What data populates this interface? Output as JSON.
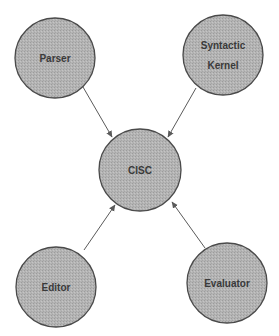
{
  "diagram": {
    "colors": {
      "node_fill": "#b4b4b4",
      "node_stroke": "#4a4a4a",
      "edge": "#5a5a5a",
      "text": "#3a3a3a",
      "background": "#ffffff"
    },
    "nodes": [
      {
        "id": "parser",
        "lines": [
          "Parser"
        ],
        "cx": 55,
        "cy": 58,
        "r": 40
      },
      {
        "id": "syntactic-kernel",
        "lines": [
          "Syntactic",
          "Kernel"
        ],
        "cx": 223,
        "cy": 55,
        "r": 40
      },
      {
        "id": "cisc",
        "lines": [
          "CISC"
        ],
        "cx": 140,
        "cy": 170,
        "r": 41
      },
      {
        "id": "editor",
        "lines": [
          "Editor"
        ],
        "cx": 56,
        "cy": 287,
        "r": 40
      },
      {
        "id": "evaluator",
        "lines": [
          "Evaluator"
        ],
        "cx": 227,
        "cy": 283,
        "r": 40
      }
    ],
    "edges": [
      {
        "from": "parser",
        "to": "cisc",
        "arrow": "to"
      },
      {
        "from": "syntactic-kernel",
        "to": "cisc",
        "arrow": "to"
      },
      {
        "from": "editor",
        "to": "cisc",
        "arrow": "to"
      },
      {
        "from": "evaluator",
        "to": "cisc",
        "arrow": "to"
      }
    ]
  }
}
